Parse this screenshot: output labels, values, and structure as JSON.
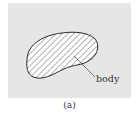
{
  "figure": {
    "label": "body",
    "caption": "(a)",
    "colors": {
      "background": "#e6e6e6",
      "outline": "#2a2a2a",
      "hatch": "#555555",
      "fill": "#ffffff",
      "text": "#333333"
    }
  }
}
